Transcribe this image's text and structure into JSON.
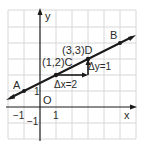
{
  "diagram": {
    "type": "coordinate-plane",
    "axes": {
      "x_label": "x",
      "y_label": "y",
      "origin_label": "O"
    },
    "ticks": {
      "x_pos": "1",
      "x_neg": "−1",
      "y_pos": "1",
      "y_neg": "−1"
    },
    "points": {
      "A": {
        "label": "A",
        "x": -1,
        "y": 1
      },
      "B": {
        "label": "B",
        "x": 5,
        "y": 4
      },
      "C": {
        "label": "(1,2)C",
        "x": 1,
        "y": 2
      },
      "D": {
        "label": "(3,3)D",
        "x": 3,
        "y": 3
      }
    },
    "delta_x_label": "Δx=2",
    "delta_y_label": "Δy=1",
    "colors": {
      "grid": "#d8d8d8",
      "ink": "#1a1a1a"
    }
  }
}
